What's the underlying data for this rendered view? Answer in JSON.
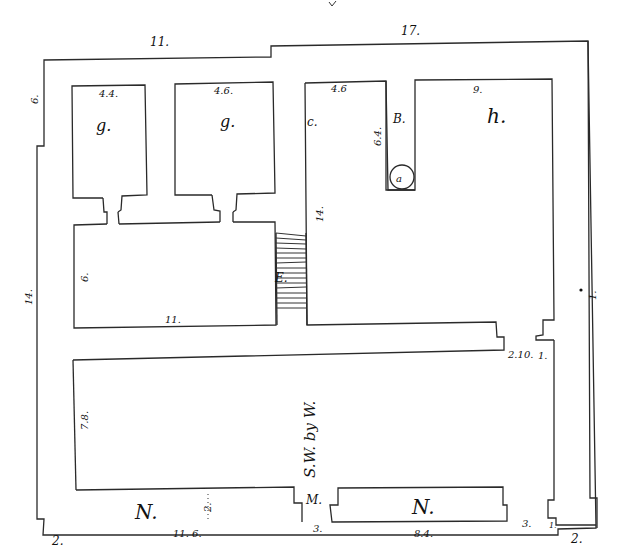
{
  "drawing": {
    "type": "architectural floor plan (hand-drawn sketch)",
    "line_color": "#2a2a2a",
    "background": "#ffffff"
  },
  "rooms": {
    "small_room_1": "g.",
    "small_room_2": "g.",
    "room_c": "c.",
    "passage_b": "B.",
    "well_a": "a",
    "room_h": "h.",
    "stairs_e": "E.",
    "entrance_m": "M.",
    "bench_n_left": "N.",
    "bench_n_right": "N."
  },
  "orientation": {
    "label": "S.W. by W."
  },
  "dimensions": {
    "top_left_wall": "11.",
    "top_right_wall": "17.",
    "left_upper_offset": "6.",
    "left_wall": "14.",
    "right_wall": "1.",
    "room_g1_width": "4.4.",
    "room_g2_width": "4.6.",
    "room_c_width": "4.6",
    "passage_b_length": "6.4.",
    "room_h_width": "9.",
    "room_c_height": "14.",
    "hall_height": "6.",
    "hall_width": "11.",
    "court_height": "7.8.",
    "step_right_1": "2.10.",
    "step_right_2": "1.",
    "bench_left_depth": "2.",
    "bottom_left_corner": "2.",
    "bottom_left_length": "11. 6.",
    "entrance_width": "3.",
    "bottom_right_bench": "8.4.",
    "bottom_right_gap": "3.",
    "bottom_right_step": "1.",
    "bottom_right_corner": "2."
  }
}
